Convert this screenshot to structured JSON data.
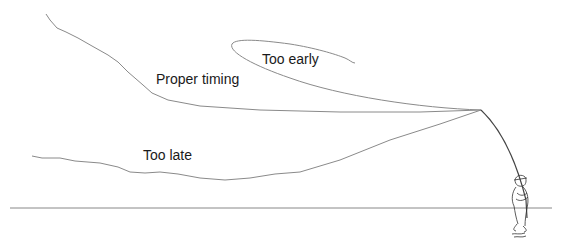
{
  "diagram": {
    "type": "fly-casting-timing",
    "labels": {
      "proper_timing": "Proper timing",
      "too_early": "Too early",
      "too_late": "Too late"
    },
    "elements": [
      {
        "name": "proper-timing-line",
        "description": "Line extended straight back from rod tip"
      },
      {
        "name": "too-early-line",
        "description": "Line forms loop, not yet extended"
      },
      {
        "name": "too-late-line",
        "description": "Line dropped toward ground"
      },
      {
        "name": "fly-rod",
        "description": "Bent rod held by angler"
      },
      {
        "name": "angler",
        "description": "Person standing in water"
      },
      {
        "name": "ground-line",
        "description": "Horizontal water/ground reference"
      }
    ],
    "colors": {
      "line": "#8a8a8a",
      "rod": "#444444",
      "text": "#1a1a1a"
    }
  }
}
